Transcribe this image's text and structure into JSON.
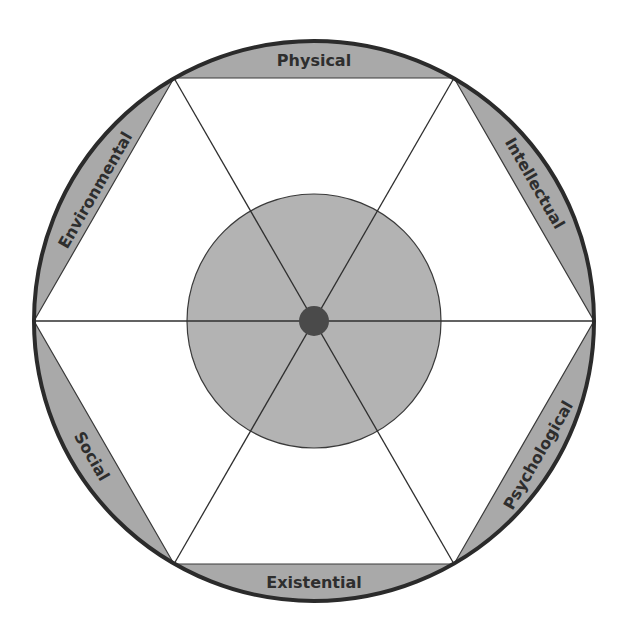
{
  "diagram": {
    "type": "wellness-wheel",
    "center": [
      314,
      321
    ],
    "outer_radius": 280,
    "inner_radius": 127,
    "hub_radius": 15,
    "colors": {
      "background": "#ffffff",
      "segment_fill": "#a9a9a9",
      "inner_circle_fill": "#b3b3b3",
      "hub_fill": "#4a4a4a",
      "outline": "#2b2b2b",
      "label_text": "#2e2e2e"
    },
    "segments": [
      {
        "label": "Physical",
        "position": "top"
      },
      {
        "label": "Intellectual",
        "position": "upper-right"
      },
      {
        "label": "Psychological",
        "position": "lower-right"
      },
      {
        "label": "Existential",
        "position": "bottom"
      },
      {
        "label": "Social",
        "position": "lower-left"
      },
      {
        "label": "Environmental",
        "position": "upper-left"
      }
    ]
  }
}
